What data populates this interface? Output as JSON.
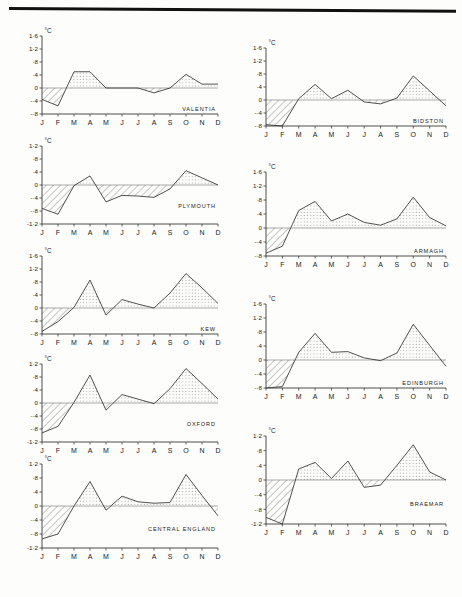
{
  "figure": {
    "units_label": "°C",
    "month_labels": [
      "J",
      "F",
      "M",
      "A",
      "M",
      "J",
      "J",
      "A",
      "S",
      "O",
      "N",
      "D"
    ],
    "top_rule": "page-edge-rule"
  },
  "chart_data": [
    {
      "type": "area",
      "title": "VALENTIA",
      "xlabel": "",
      "ylabel": "°C",
      "categories": [
        "J",
        "F",
        "M",
        "A",
        "M",
        "J",
        "J",
        "A",
        "S",
        "O",
        "N",
        "D"
      ],
      "values": [
        -0.35,
        -0.55,
        0.5,
        0.5,
        0.0,
        0.0,
        0.0,
        -0.15,
        0.0,
        0.42,
        0.12,
        0.12
      ],
      "ylim": [
        -0.8,
        1.6
      ],
      "yticks": [
        1.6,
        1.2,
        0.8,
        0.4,
        0,
        -0.4,
        -0.8
      ],
      "ytick_labels": [
        "1·6",
        "1·2",
        "·8",
        "·4",
        "0",
        "-·4",
        "-·8"
      ],
      "grid": false,
      "legend": "none",
      "positive_fill": "dotted",
      "negative_fill": "hatched"
    },
    {
      "type": "area",
      "title": "PLYMOUTH",
      "xlabel": "",
      "ylabel": "°C",
      "categories": [
        "J",
        "F",
        "M",
        "A",
        "M",
        "J",
        "J",
        "A",
        "S",
        "O",
        "N",
        "D"
      ],
      "values": [
        -0.72,
        -0.9,
        -0.02,
        0.28,
        -0.52,
        -0.32,
        -0.34,
        -0.38,
        -0.12,
        0.44,
        0.22,
        0.0
      ],
      "ylim": [
        -1.2,
        1.2
      ],
      "yticks": [
        1.2,
        0.8,
        0.4,
        0,
        -0.4,
        -0.8,
        -1.2
      ],
      "ytick_labels": [
        "1·2",
        "·8",
        "·4",
        "0",
        "-·4",
        "-·8",
        "-1·2"
      ],
      "grid": false,
      "legend": "none",
      "positive_fill": "dotted",
      "negative_fill": "hatched"
    },
    {
      "type": "area",
      "title": "KEW",
      "xlabel": "",
      "ylabel": "°C",
      "categories": [
        "J",
        "F",
        "M",
        "A",
        "M",
        "J",
        "J",
        "A",
        "S",
        "O",
        "N",
        "D"
      ],
      "values": [
        -0.72,
        -0.42,
        0.02,
        0.86,
        -0.22,
        0.26,
        0.12,
        0.0,
        0.46,
        1.06,
        0.62,
        0.14
      ],
      "ylim": [
        -0.8,
        1.6
      ],
      "yticks": [
        1.6,
        1.2,
        0.8,
        0.4,
        0,
        -0.4,
        -0.8
      ],
      "ytick_labels": [
        "1·6",
        "1·2",
        "·8",
        "·4",
        "0",
        "-·4",
        "-·8"
      ],
      "grid": false,
      "legend": "none",
      "positive_fill": "dotted",
      "negative_fill": "hatched"
    },
    {
      "type": "area",
      "title": "OXFORD",
      "xlabel": "",
      "ylabel": "°C",
      "categories": [
        "J",
        "F",
        "M",
        "A",
        "M",
        "J",
        "J",
        "A",
        "S",
        "O",
        "N",
        "D"
      ],
      "values": [
        -0.92,
        -0.72,
        0.02,
        0.86,
        -0.22,
        0.26,
        0.12,
        -0.02,
        0.44,
        1.06,
        0.6,
        0.12
      ],
      "ylim": [
        -1.2,
        1.2
      ],
      "yticks": [
        1.2,
        0.8,
        0.4,
        0,
        -0.4,
        -0.8,
        -1.2
      ],
      "ytick_labels": [
        "1·2",
        "·8",
        "·4",
        "0",
        "-·4",
        "-·8",
        "-1·2"
      ],
      "grid": false,
      "legend": "none",
      "positive_fill": "dotted",
      "negative_fill": "hatched"
    },
    {
      "type": "area",
      "title": "CENTRAL ENGLAND",
      "xlabel": "",
      "ylabel": "°C",
      "categories": [
        "J",
        "F",
        "M",
        "A",
        "M",
        "J",
        "J",
        "A",
        "S",
        "O",
        "N",
        "D"
      ],
      "values": [
        -0.94,
        -0.8,
        0.0,
        0.7,
        -0.12,
        0.28,
        0.12,
        0.08,
        0.1,
        0.9,
        0.3,
        -0.28
      ],
      "ylim": [
        -1.2,
        1.2
      ],
      "yticks": [
        1.2,
        0.8,
        0.4,
        0,
        -0.4,
        -0.8,
        -1.2
      ],
      "ytick_labels": [
        "1·2",
        "·8",
        "·4",
        "0",
        "-·4",
        "-·8",
        "-1·2"
      ],
      "grid": false,
      "legend": "none",
      "positive_fill": "dotted",
      "negative_fill": "hatched"
    },
    {
      "type": "area",
      "title": "BIDSTON",
      "xlabel": "",
      "ylabel": "°C",
      "categories": [
        "J",
        "F",
        "M",
        "A",
        "M",
        "J",
        "J",
        "A",
        "S",
        "O",
        "N",
        "D"
      ],
      "values": [
        -0.76,
        -0.8,
        0.04,
        0.48,
        0.04,
        0.3,
        -0.06,
        -0.12,
        0.06,
        0.74,
        0.28,
        -0.18
      ],
      "ylim": [
        -0.8,
        1.6
      ],
      "yticks": [
        1.6,
        1.2,
        0.8,
        0.4,
        0,
        -0.4,
        -0.8
      ],
      "ytick_labels": [
        "1·6",
        "1·2",
        "·8",
        "·4",
        "0",
        "-·4",
        "-·8"
      ],
      "grid": false,
      "legend": "none",
      "positive_fill": "dotted",
      "negative_fill": "hatched"
    },
    {
      "type": "area",
      "title": "ARMAGH",
      "xlabel": "",
      "ylabel": "°C",
      "categories": [
        "J",
        "F",
        "M",
        "A",
        "M",
        "J",
        "J",
        "A",
        "S",
        "O",
        "N",
        "D"
      ],
      "values": [
        -0.72,
        -0.52,
        0.5,
        0.76,
        0.2,
        0.4,
        0.16,
        0.08,
        0.26,
        0.88,
        0.3,
        0.06
      ],
      "ylim": [
        -0.8,
        1.6
      ],
      "yticks": [
        1.6,
        1.2,
        0.8,
        0.4,
        0,
        -0.4,
        -0.8
      ],
      "ytick_labels": [
        "1·6",
        "1·2",
        "·8",
        "·4",
        "0",
        "-·4",
        "-·8"
      ],
      "grid": false,
      "legend": "none",
      "positive_fill": "dotted",
      "negative_fill": "hatched"
    },
    {
      "type": "area",
      "title": "EDINBURGH",
      "xlabel": "",
      "ylabel": "°C",
      "categories": [
        "J",
        "F",
        "M",
        "A",
        "M",
        "J",
        "J",
        "A",
        "S",
        "O",
        "N",
        "D"
      ],
      "values": [
        -0.8,
        -0.76,
        0.22,
        0.76,
        0.22,
        0.24,
        0.06,
        -0.02,
        0.2,
        1.02,
        0.42,
        -0.18
      ],
      "ylim": [
        -0.8,
        1.6
      ],
      "yticks": [
        1.6,
        1.2,
        0.8,
        0.4,
        0,
        -0.4,
        -0.8
      ],
      "ytick_labels": [
        "1·6",
        "1·2",
        "·8",
        "·4",
        "0",
        "-·4",
        "-·8"
      ],
      "grid": false,
      "legend": "none",
      "positive_fill": "dotted",
      "negative_fill": "hatched"
    },
    {
      "type": "area",
      "title": "BRAEMAR",
      "xlabel": "",
      "ylabel": "°C",
      "categories": [
        "J",
        "F",
        "M",
        "A",
        "M",
        "J",
        "J",
        "A",
        "S",
        "O",
        "N",
        "D"
      ],
      "values": [
        -1.02,
        -1.2,
        0.3,
        0.48,
        0.04,
        0.52,
        -0.2,
        -0.14,
        0.4,
        0.96,
        0.22,
        0.0
      ],
      "ylim": [
        -1.2,
        1.2
      ],
      "yticks": [
        1.2,
        0.8,
        0.4,
        0,
        -0.4,
        -0.8,
        -1.2
      ],
      "ytick_labels": [
        "1·2",
        "·8",
        "·4",
        "0",
        "-·4",
        "-·8",
        "-1·2"
      ],
      "grid": false,
      "legend": "none",
      "positive_fill": "dotted",
      "negative_fill": "hatched"
    }
  ],
  "panel_layout": [
    {
      "name": "valentia",
      "x": 12,
      "y": 24,
      "w": 212,
      "h": 112
    },
    {
      "name": "plymouth",
      "x": 12,
      "y": 134,
      "w": 212,
      "h": 112
    },
    {
      "name": "kew",
      "x": 12,
      "y": 244,
      "w": 212,
      "h": 112
    },
    {
      "name": "oxford",
      "x": 12,
      "y": 352,
      "w": 212,
      "h": 112
    },
    {
      "name": "central-england",
      "x": 12,
      "y": 452,
      "w": 212,
      "h": 118
    },
    {
      "name": "bidston",
      "x": 236,
      "y": 36,
      "w": 216,
      "h": 112
    },
    {
      "name": "armagh",
      "x": 236,
      "y": 160,
      "w": 216,
      "h": 118
    },
    {
      "name": "edinburgh",
      "x": 236,
      "y": 292,
      "w": 216,
      "h": 118
    },
    {
      "name": "braemar",
      "x": 236,
      "y": 424,
      "w": 216,
      "h": 122
    }
  ]
}
